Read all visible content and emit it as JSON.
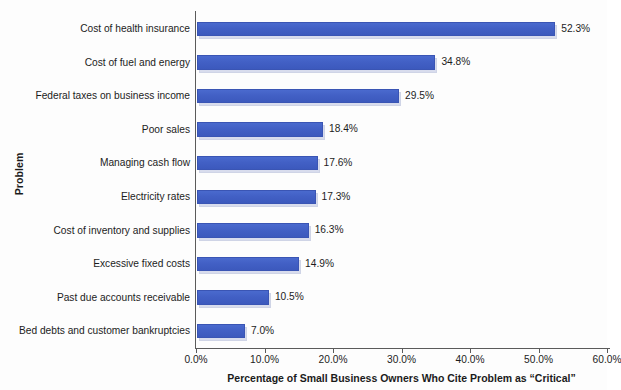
{
  "chart_data": {
    "type": "bar",
    "orientation": "horizontal",
    "title": "",
    "xlabel": "Percentage of Small Business Owners Who Cite Problem as “Critical”",
    "ylabel": "Problem",
    "xlim": [
      0,
      60
    ],
    "xtick_labels": [
      "0.0%",
      "10.0%",
      "20.0%",
      "30.0%",
      "40.0%",
      "50.0%",
      "60.0%"
    ],
    "xtick_values": [
      0,
      10,
      20,
      30,
      40,
      50,
      60
    ],
    "grid": false,
    "legend": null,
    "bar_color": "#4260c5",
    "shadow_color": "#d8dced",
    "categories": [
      "Cost of health insurance",
      "Cost of fuel and energy",
      "Federal taxes on business income",
      "Poor sales",
      "Managing cash flow",
      "Electricity rates",
      "Cost of inventory and supplies",
      "Excessive fixed costs",
      "Past due accounts receivable",
      "Bed debts and customer bankruptcies"
    ],
    "values": [
      52.3,
      34.8,
      29.5,
      18.4,
      17.6,
      17.3,
      16.3,
      14.9,
      10.5,
      7.0
    ],
    "value_labels": [
      "52.3%",
      "34.8%",
      "29.5%",
      "18.4%",
      "17.6%",
      "17.3%",
      "16.3%",
      "14.9%",
      "10.5%",
      "7.0%"
    ]
  }
}
